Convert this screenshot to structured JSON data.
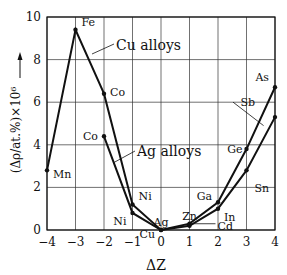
{
  "chart_data": {
    "type": "line",
    "title": "",
    "xlabel": "ΔZ",
    "ylabel": "(Δρ/at.%)×10⁶",
    "xlim": [
      -4,
      4
    ],
    "ylim": [
      0,
      10
    ],
    "x_ticks": [
      "-4",
      "-3",
      "-2",
      "-1",
      "0",
      "1",
      "2",
      "3",
      "4"
    ],
    "y_ticks": [
      "0",
      "2",
      "4",
      "6",
      "8",
      "10"
    ],
    "grid": true,
    "series": [
      {
        "name": "Cu alloys",
        "points": [
          {
            "x": -4,
            "y": 2.8,
            "label": "Mn"
          },
          {
            "x": -3,
            "y": 9.4,
            "label": "Fe"
          },
          {
            "x": -2,
            "y": 6.4,
            "label": "Co"
          },
          {
            "x": -1,
            "y": 1.2,
            "label": "Ni"
          },
          {
            "x": 0,
            "y": 0.0,
            "label": "Cu"
          },
          {
            "x": 1,
            "y": 0.3,
            "label": "Zn"
          },
          {
            "x": 2,
            "y": 1.3,
            "label": "Ga"
          },
          {
            "x": 3,
            "y": 3.8,
            "label": "Ge"
          },
          {
            "x": 4,
            "y": 6.7,
            "label": "As"
          }
        ]
      },
      {
        "name": "Ag alloys",
        "points": [
          {
            "x": -2,
            "y": 4.4,
            "label": "Co"
          },
          {
            "x": -1,
            "y": 0.8,
            "label": "Ni"
          },
          {
            "x": 0,
            "y": 0.0,
            "label": "Ag"
          },
          {
            "x": 1,
            "y": 0.2,
            "label": "Cd"
          },
          {
            "x": 2,
            "y": 1.0,
            "label": "In"
          },
          {
            "x": 3,
            "y": 2.8,
            "label": "Sn"
          },
          {
            "x": 4,
            "y": 5.3,
            "label": "Sb"
          }
        ]
      }
    ],
    "annotations": [
      "Cu alloys",
      "Ag alloys"
    ]
  }
}
